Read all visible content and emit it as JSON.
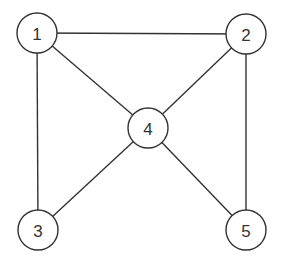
{
  "graph": {
    "nodes": [
      {
        "id": "1",
        "label": "1",
        "x": 37,
        "y": 33
      },
      {
        "id": "2",
        "label": "2",
        "x": 246,
        "y": 34
      },
      {
        "id": "3",
        "label": "3",
        "x": 38,
        "y": 230
      },
      {
        "id": "4",
        "label": "4",
        "x": 148,
        "y": 128
      },
      {
        "id": "5",
        "label": "5",
        "x": 246,
        "y": 230
      }
    ],
    "edges": [
      [
        "1",
        "2"
      ],
      [
        "1",
        "4"
      ],
      [
        "1",
        "3"
      ],
      [
        "2",
        "4"
      ],
      [
        "2",
        "5"
      ],
      [
        "4",
        "3"
      ],
      [
        "4",
        "5"
      ]
    ],
    "node_radius": 20,
    "stroke_color": "#333333"
  }
}
